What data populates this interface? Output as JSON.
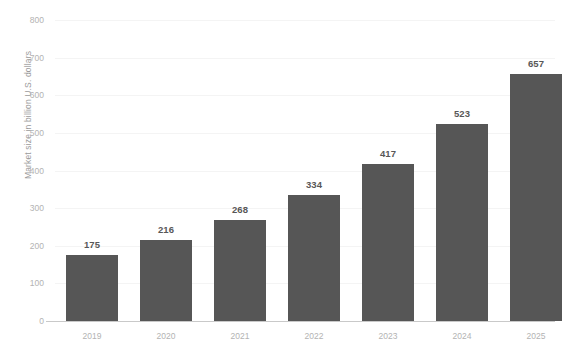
{
  "chart_data": {
    "type": "bar",
    "title": "",
    "subtitle": "",
    "xlabel": "",
    "ylabel": "Market size in billion U.S. dollars",
    "categories": [
      "2019",
      "2020",
      "2021",
      "2022",
      "2023",
      "2024",
      "2025"
    ],
    "values": [
      175,
      216,
      268,
      334,
      417,
      523,
      657
    ],
    "value_labels": [
      "175",
      "216",
      "268",
      "334",
      "417",
      "523",
      "657"
    ],
    "ylim": [
      0,
      800
    ],
    "ytick_values": [
      0,
      100,
      200,
      300,
      400,
      500,
      600,
      700,
      800
    ],
    "ytick_labels": [
      "0",
      "100",
      "200",
      "300",
      "400",
      "500",
      "600",
      "700",
      "800"
    ],
    "grid": true,
    "grid_axis": "y",
    "legend": false,
    "legend_position": "none",
    "orientation": "vertical",
    "series": [
      {
        "name": "Market size",
        "values": [
          175,
          216,
          268,
          334,
          417,
          523,
          657
        ],
        "color": "#565656"
      }
    ],
    "colors": {
      "bar": "#565656",
      "background": "#ffffff",
      "gridline": "#f4f4f4",
      "axis_line": "#c9c9c9",
      "tick_label": "#b3b3b3",
      "axis_title": "#9b9b9b",
      "value_label": "#575757"
    }
  }
}
